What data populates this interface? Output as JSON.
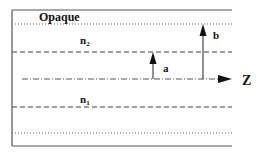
{
  "diagram": {
    "title_region": "Opaque",
    "labels": {
      "n2": "n",
      "n2_sub": "2",
      "n1": "n",
      "n1_sub": "1",
      "a": "a",
      "b": "b",
      "z": "Z"
    },
    "colors": {
      "line": "#333333",
      "background": "#ffffff"
    }
  }
}
